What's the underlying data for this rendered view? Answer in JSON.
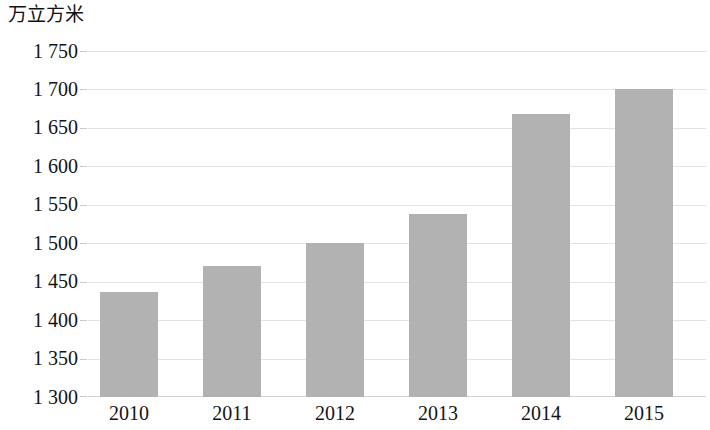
{
  "chart_data": {
    "type": "bar",
    "title": "",
    "subtitle": "",
    "xlabel": "",
    "ylabel": "万立方米",
    "categories": [
      "2010",
      "2011",
      "2012",
      "2013",
      "2014",
      "2015"
    ],
    "values": [
      1437,
      1470,
      1500,
      1538,
      1668,
      1700
    ],
    "series": [
      {
        "name": "万立方米",
        "values": [
          1437,
          1470,
          1500,
          1538,
          1668,
          1700
        ]
      }
    ],
    "ylim": [
      1300,
      1750
    ],
    "ytick_step": 50,
    "ytick_labels": [
      "1 750",
      "1 700",
      "1 650",
      "1 600",
      "1 550",
      "1 500",
      "1 450",
      "1 400",
      "1 350",
      "1 300"
    ],
    "ytick_values": [
      1750,
      1700,
      1650,
      1600,
      1550,
      1500,
      1450,
      1400,
      1350,
      1300
    ],
    "grid": true,
    "legend": false,
    "legend_position": "none",
    "bar_color": "#b2b2b2",
    "gridline_color": "#e3e3e3",
    "background_color": "#ffffff",
    "text_color": "#141414"
  }
}
